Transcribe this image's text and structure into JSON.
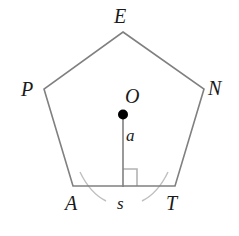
{
  "figure": {
    "type": "geometry-diagram",
    "shape": "regular-pentagon",
    "colors": {
      "outline": "#808080",
      "apothem_line": "#808080",
      "center_dot": "#000000",
      "right_angle_mark": "#b3b3b3",
      "arc": "#bfbfbf",
      "label_text": "#1a1a1a",
      "background": "#ffffff"
    },
    "vertices": [
      {
        "label": "E",
        "x": 123,
        "y": 32
      },
      {
        "label": "N",
        "x": 204,
        "y": 89
      },
      {
        "label": "T",
        "x": 175,
        "y": 186
      },
      {
        "label": "A",
        "x": 73,
        "y": 186
      },
      {
        "label": "P",
        "x": 44,
        "y": 89
      }
    ],
    "center": {
      "label": "O",
      "x": 123,
      "y": 115
    },
    "apothem": {
      "label": "a",
      "from_x": 123,
      "from_y": 115,
      "to_x": 123,
      "to_y": 186
    },
    "side_label": "s",
    "right_angle_mark": {
      "x": 123,
      "y": 169,
      "size": 14
    },
    "arcs": [
      {
        "name": "arc-near-a",
        "d": "M 80 172 Q 90 193 106 201"
      },
      {
        "name": "arc-near-t",
        "d": "M 168 172 Q 158 193 142 201"
      }
    ]
  }
}
